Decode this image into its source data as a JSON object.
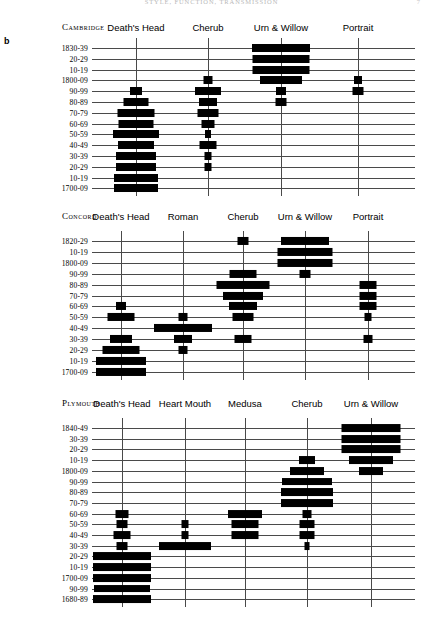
{
  "page": {
    "running_head": "STYLE, FUNCTION, TRANSMISSION",
    "folio": "7",
    "panel_letter": "b"
  },
  "figure": {
    "type": "seriation",
    "bar_unit": "relative frequency (percent of stones per decade)"
  },
  "charts": [
    {
      "site": "Cambridge",
      "site_x": 62,
      "site_y": 22,
      "label_right": 92,
      "top": 48,
      "row_step": 10.8,
      "columns": [
        {
          "name": "Death's Head",
          "center": 136
        },
        {
          "name": "Cherub",
          "center": 208
        },
        {
          "name": "Urn & Willow",
          "center": 281
        },
        {
          "name": "Portrait",
          "center": 358
        }
      ],
      "rows": [
        "1830-39",
        "20-29",
        "10-19",
        "1800-09",
        "90-99",
        "80-89",
        "70-79",
        "60-69",
        "50-59",
        "40-49",
        "30-39",
        "20-29",
        "10-19",
        "1700-09"
      ],
      "series": [
        {
          "column": "Death's Head",
          "widths": [
            0,
            0,
            0,
            0,
            12,
            25,
            37,
            35,
            46,
            36,
            40,
            40,
            44,
            44
          ]
        },
        {
          "column": "Cherub",
          "widths": [
            0,
            0,
            0,
            9,
            26,
            18,
            21,
            13,
            6,
            17,
            7,
            7,
            0,
            0
          ]
        },
        {
          "column": "Urn & Willow",
          "widths": [
            58,
            57,
            57,
            42,
            10,
            11,
            0,
            0,
            0,
            0,
            0,
            0,
            0,
            0
          ]
        },
        {
          "column": "Portrait",
          "widths": [
            0,
            0,
            0,
            8,
            11,
            0,
            0,
            0,
            0,
            0,
            0,
            0,
            0,
            0
          ]
        }
      ]
    },
    {
      "site": "Concord",
      "site_x": 62,
      "site_y": 211,
      "label_right": 92,
      "top": 241,
      "row_step": 10.9,
      "columns": [
        {
          "name": "Death's Head",
          "center": 121
        },
        {
          "name": "Roman",
          "center": 183
        },
        {
          "name": "Cherub",
          "center": 243
        },
        {
          "name": "Urn & Willow",
          "center": 305
        },
        {
          "name": "Portrait",
          "center": 368
        }
      ],
      "rows": [
        "1820-29",
        "10-19",
        "1800-09",
        "90-99",
        "80-89",
        "70-79",
        "60-69",
        "50-59",
        "40-49",
        "30-39",
        "20-29",
        "10-19",
        "1700-09"
      ],
      "series": [
        {
          "column": "Death's Head",
          "widths": [
            0,
            0,
            0,
            0,
            0,
            0,
            10,
            27,
            0,
            22,
            37,
            50,
            50
          ]
        },
        {
          "column": "Roman",
          "widths": [
            0,
            0,
            0,
            0,
            0,
            0,
            0,
            9,
            58,
            18,
            9,
            0,
            0
          ]
        },
        {
          "column": "Cherub",
          "widths": [
            11,
            0,
            0,
            27,
            53,
            40,
            28,
            21,
            0,
            17,
            0,
            0,
            0
          ]
        },
        {
          "column": "Urn & Willow",
          "widths": [
            48,
            55,
            55,
            11,
            0,
            0,
            0,
            0,
            0,
            0,
            0,
            0,
            0
          ]
        },
        {
          "column": "Portrait",
          "widths": [
            0,
            0,
            0,
            0,
            17,
            17,
            17,
            7,
            0,
            9,
            0,
            0,
            0
          ]
        }
      ]
    },
    {
      "site": "Plymouth",
      "site_x": 62,
      "site_y": 398,
      "label_right": 92,
      "top": 428,
      "row_step": 10.7,
      "columns": [
        {
          "name": "Death's Head",
          "center": 122
        },
        {
          "name": "Heart Mouth",
          "center": 185
        },
        {
          "name": "Medusa",
          "center": 245
        },
        {
          "name": "Cherub",
          "center": 307
        },
        {
          "name": "Urn & Willow",
          "center": 371
        }
      ],
      "rows": [
        "1840-49",
        "30-39",
        "20-29",
        "10-19",
        "1800-09",
        "90-99",
        "80-89",
        "70-79",
        "60-69",
        "50-59",
        "40-49",
        "30-39",
        "20-29",
        "10-19",
        "1700-09",
        "90-99",
        "1680-89"
      ],
      "series": [
        {
          "column": "Death's Head",
          "widths": [
            0,
            0,
            0,
            0,
            0,
            0,
            0,
            0,
            13,
            11,
            17,
            11,
            58,
            58,
            58,
            56,
            58
          ]
        },
        {
          "column": "Heart Mouth",
          "widths": [
            0,
            0,
            0,
            0,
            0,
            0,
            0,
            0,
            0,
            7,
            7,
            52,
            0,
            0,
            0,
            0,
            0
          ]
        },
        {
          "column": "Medusa",
          "widths": [
            0,
            0,
            0,
            0,
            0,
            0,
            0,
            0,
            34,
            27,
            27,
            0,
            0,
            0,
            0,
            0,
            0
          ]
        },
        {
          "column": "Cherub",
          "widths": [
            0,
            0,
            0,
            16,
            34,
            50,
            52,
            52,
            9,
            15,
            15,
            5,
            0,
            0,
            0,
            0,
            0
          ]
        },
        {
          "column": "Urn & Willow",
          "widths": [
            59,
            59,
            59,
            44,
            24,
            0,
            0,
            0,
            0,
            0,
            0,
            0,
            0,
            0,
            0,
            0,
            0
          ]
        }
      ]
    }
  ]
}
